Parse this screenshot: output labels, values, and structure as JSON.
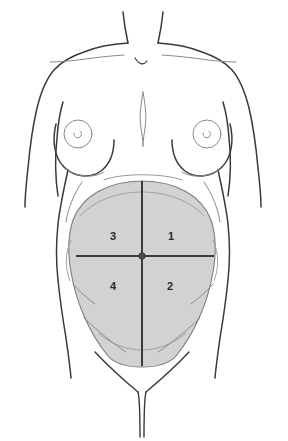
{
  "figure": {
    "name": "abdominal-quadrants-diagram",
    "background_color": "#ffffff",
    "outline_color": "#3a3a3a",
    "faint_outline_color": "#8a8a8a",
    "shading_color": "#d2d2d2",
    "shading_edge_color": "#7d7d7d",
    "crosshair_color": "#3c3c3c",
    "label_color": "#2b2b2b"
  },
  "quadrants": [
    {
      "id": "quadrant-1",
      "label": "1",
      "position": "upper-right",
      "x": 171,
      "y": 237
    },
    {
      "id": "quadrant-2",
      "label": "2",
      "position": "lower-right",
      "x": 170,
      "y": 287
    },
    {
      "id": "quadrant-3",
      "label": "3",
      "position": "upper-left",
      "x": 113,
      "y": 237
    },
    {
      "id": "quadrant-4",
      "label": "4",
      "position": "lower-left",
      "x": 113,
      "y": 287
    }
  ],
  "landmarks": {
    "umbilicus": {
      "name": "umbilicus-marker",
      "x": 142,
      "y": 256
    },
    "vertical_midline": {
      "name": "vertical-divider",
      "x": 142,
      "y1": 181,
      "y2": 366
    },
    "horizontal_midline": {
      "name": "horizontal-divider",
      "y": 256,
      "x1": 76,
      "x2": 214
    },
    "left_nipple": {
      "name": "left-nipple",
      "x": 78,
      "y": 134
    },
    "right_nipple": {
      "name": "right-nipple",
      "x": 207,
      "y": 134
    },
    "suprasternal_notch": {
      "name": "suprasternal-notch",
      "x": 143,
      "y": 61
    }
  }
}
